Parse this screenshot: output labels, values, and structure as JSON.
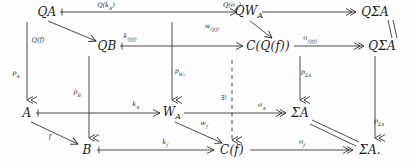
{
  "diagram": {
    "kind": "commutative-diagram",
    "nodes": [
      {
        "id": "QA",
        "label": "QA",
        "x": 47,
        "y": 12
      },
      {
        "id": "QWA",
        "label": "QWₐ",
        "x": 249,
        "y": 12
      },
      {
        "id": "QSA1",
        "label": "QΣA",
        "x": 375,
        "y": 12
      },
      {
        "id": "QB",
        "label": "QB",
        "x": 107,
        "y": 46
      },
      {
        "id": "CQf",
        "label": "C(Q(f))",
        "x": 268,
        "y": 46
      },
      {
        "id": "QSA2",
        "label": "QΣA",
        "x": 382,
        "y": 46
      },
      {
        "id": "A",
        "label": "A",
        "x": 27,
        "y": 113
      },
      {
        "id": "WA",
        "label": "Wₐ",
        "x": 172,
        "y": 113
      },
      {
        "id": "SA1",
        "label": "ΣA",
        "x": 300,
        "y": 113
      },
      {
        "id": "B",
        "label": "B",
        "x": 87,
        "y": 150
      },
      {
        "id": "Cf",
        "label": "C(f)",
        "x": 232,
        "y": 150
      },
      {
        "id": "SA2",
        "label": "ΣA.",
        "x": 370,
        "y": 150
      }
    ],
    "arrow_labels": [
      {
        "id": "Qk_A",
        "text": "Q(k",
        "sub": "A",
        "tail": ")",
        "x": 106,
        "y": 6
      },
      {
        "id": "Qsigma_A",
        "text": "Q(σ",
        "sub": "A",
        "tail": ")",
        "x": 232,
        "y": 6
      },
      {
        "id": "Qf",
        "text": "Q(f)",
        "sub": "",
        "tail": "",
        "x": 38,
        "y": 40
      },
      {
        "id": "kQf",
        "text": "k",
        "sub": "Q(f)",
        "tail": "",
        "x": 130,
        "y": 37
      },
      {
        "id": "wQf",
        "text": "w",
        "sub": "Q(f)",
        "tail": "",
        "x": 212,
        "y": 27
      },
      {
        "id": "sigmaQf",
        "text": "σ",
        "sub": "Q(f)",
        "tail": "",
        "x": 310,
        "y": 39
      },
      {
        "id": "p_A",
        "text": "p",
        "sub": "A",
        "tail": "",
        "x": 16,
        "y": 74
      },
      {
        "id": "p_B",
        "text": "p",
        "sub": "B",
        "tail": "",
        "x": 77,
        "y": 93
      },
      {
        "id": "p_WA",
        "text": "p",
        "sub": "Wₐ",
        "tail": "",
        "x": 180,
        "y": 72
      },
      {
        "id": "p_SA_up",
        "text": "p",
        "sub": "ΣA",
        "tail": "",
        "x": 306,
        "y": 73
      },
      {
        "id": "p_SA_rt",
        "text": "p",
        "sub": "ΣA",
        "tail": "",
        "x": 379,
        "y": 122
      },
      {
        "id": "k_A",
        "text": "k",
        "sub": "A",
        "tail": "",
        "x": 136,
        "y": 105
      },
      {
        "id": "f",
        "text": "f",
        "sub": "",
        "tail": "",
        "x": 50,
        "y": 137
      },
      {
        "id": "w_f",
        "text": "w",
        "sub": "f",
        "tail": "",
        "x": 204,
        "y": 124
      },
      {
        "id": "sigma_A",
        "text": "σ",
        "sub": "A",
        "tail": "",
        "x": 262,
        "y": 106
      },
      {
        "id": "k_f",
        "text": "k",
        "sub": "f",
        "tail": "",
        "x": 165,
        "y": 143
      },
      {
        "id": "sigma_f",
        "text": "σ",
        "sub": "f",
        "tail": "",
        "x": 302,
        "y": 143
      },
      {
        "id": "exists",
        "text": "∃!",
        "sub": "",
        "tail": "",
        "x": 224,
        "y": 98
      }
    ],
    "stroke_color": "#2b2b2b",
    "background_color": "#fefefe"
  }
}
